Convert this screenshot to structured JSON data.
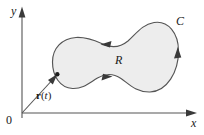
{
  "figure": {
    "kind": "vector-field-region-diagram",
    "width": 204,
    "height": 135,
    "background_color": "#ffffff"
  },
  "axes": {
    "x_axis": {
      "label": "x",
      "icon": "arrow-right-icon",
      "start_x": 22,
      "end_x": 196,
      "y": 113
    },
    "y_axis": {
      "label": "y",
      "icon": "arrow-up-icon",
      "x": 22,
      "start_y": 118,
      "end_y": 8
    },
    "origin_label": "0",
    "axis_color": "#555555"
  },
  "region": {
    "label": "R",
    "fill_color": "#ededed",
    "stroke_color": "#555555"
  },
  "curve": {
    "label": "C",
    "stroke_color": "#555555",
    "orientation": "counterclockwise",
    "direction_arrows": [
      {
        "name": "arrow-top-waist",
        "points": "left"
      },
      {
        "name": "arrow-bottom-waist",
        "points": "right"
      },
      {
        "name": "arrow-right-lobe",
        "points": "up"
      }
    ]
  },
  "vector": {
    "label_bold": "r",
    "label_paren_open": "(",
    "label_italic": "t",
    "label_paren_close": ")",
    "from": [
      22,
      113
    ],
    "to": [
      57,
      75
    ],
    "stroke_color": "#555555"
  }
}
